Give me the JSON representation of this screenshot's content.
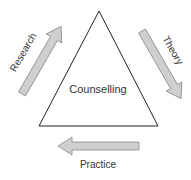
{
  "diagram": {
    "center_label": "Counselling",
    "arrows": [
      {
        "label": "Research",
        "direction": "up-right"
      },
      {
        "label": "Theory",
        "direction": "down-right"
      },
      {
        "label": "Practice",
        "direction": "left"
      }
    ],
    "colors": {
      "arrow_fill": "#cfcfcf",
      "arrow_stroke": "#8a8a8a",
      "triangle_stroke": "#222222",
      "text": "#333333"
    }
  }
}
